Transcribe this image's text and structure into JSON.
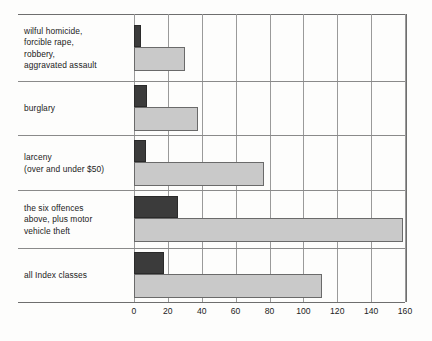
{
  "chart_data": {
    "type": "bar",
    "orientation": "horizontal",
    "title": "",
    "xlabel": "",
    "ylabel": "",
    "xlim": [
      0,
      160
    ],
    "xticks": [
      0,
      20,
      40,
      60,
      80,
      100,
      120,
      140,
      160
    ],
    "grid": true,
    "legend": "none",
    "categories": [
      "wilful homicide, forcible rape, robbery, aggravated assault",
      "burglary",
      "larceny (over and under $50)",
      "the six offences above, plus motor vehicle theft",
      "all Index classes"
    ],
    "series": [
      {
        "name": "dark",
        "values": [
          4,
          7.5,
          7,
          26,
          17.5
        ]
      },
      {
        "name": "light",
        "values": [
          30,
          38,
          77,
          159,
          111
        ]
      }
    ]
  },
  "axis": {
    "ticks": [
      {
        "label": "0",
        "value": 0
      },
      {
        "label": "20",
        "value": 20
      },
      {
        "label": "40",
        "value": 40
      },
      {
        "label": "60",
        "value": 60
      },
      {
        "label": "80",
        "value": 80
      },
      {
        "label": "100",
        "value": 100
      },
      {
        "label": "120",
        "value": 120
      },
      {
        "label": "140",
        "value": 140
      },
      {
        "label": "160",
        "value": 160
      }
    ]
  },
  "rows": [
    {
      "label_lines": [
        "wilful homicide,",
        "forcible rape,",
        "robbery,",
        "aggravated assault"
      ],
      "dark": 4,
      "light": 30
    },
    {
      "label_lines": [
        "burglary"
      ],
      "dark": 7.5,
      "light": 38
    },
    {
      "label_lines": [
        "larceny",
        "(over and under $50)"
      ],
      "dark": 7,
      "light": 77
    },
    {
      "label_lines": [
        "the six offences",
        "above, plus motor",
        "vehicle theft"
      ],
      "dark": 26,
      "light": 159
    },
    {
      "label_lines": [
        "all Index classes"
      ],
      "dark": 17.5,
      "light": 111
    }
  ],
  "colors": {
    "dark_bar": "#3b3b3b",
    "light_bar": "#c9c9c9",
    "gridline": "#9a9a9a",
    "rule": "#6e6e6e",
    "text": "#222222",
    "background": "#fdfdfc"
  }
}
